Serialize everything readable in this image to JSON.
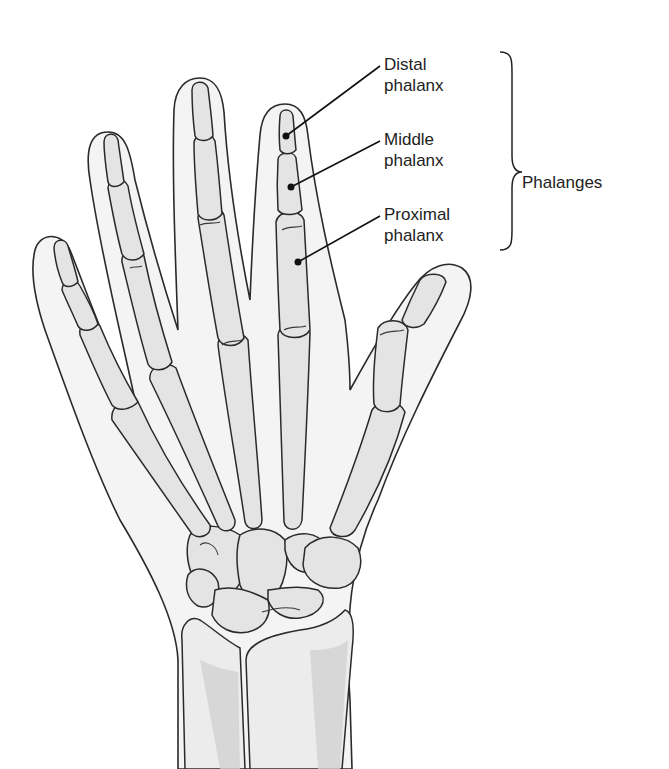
{
  "figure": {
    "colors": {
      "skin_fill": "#f4f4f4",
      "bone_fill": "#e4e4e4",
      "outline": "#2a2a2a",
      "text": "#222222"
    }
  },
  "labels": [
    {
      "id": "distal",
      "line1": "Distal",
      "line2": "phalanx",
      "x": 384,
      "y": 54,
      "pointer": {
        "x1": 380,
        "y1": 66,
        "x2": 286,
        "y2": 136
      }
    },
    {
      "id": "middle",
      "line1": "Middle",
      "line2": "phalanx",
      "x": 384,
      "y": 129,
      "pointer": {
        "x1": 380,
        "y1": 141,
        "x2": 291,
        "y2": 187
      }
    },
    {
      "id": "proximal",
      "line1": "Proximal",
      "line2": "phalanx",
      "x": 384,
      "y": 204,
      "pointer": {
        "x1": 380,
        "y1": 216,
        "x2": 298,
        "y2": 262
      }
    }
  ],
  "group": {
    "label": "Phalanges",
    "x": 522,
    "y": 173,
    "brace": {
      "x": 512,
      "top": 52,
      "bottom": 250,
      "mid": 152
    }
  }
}
